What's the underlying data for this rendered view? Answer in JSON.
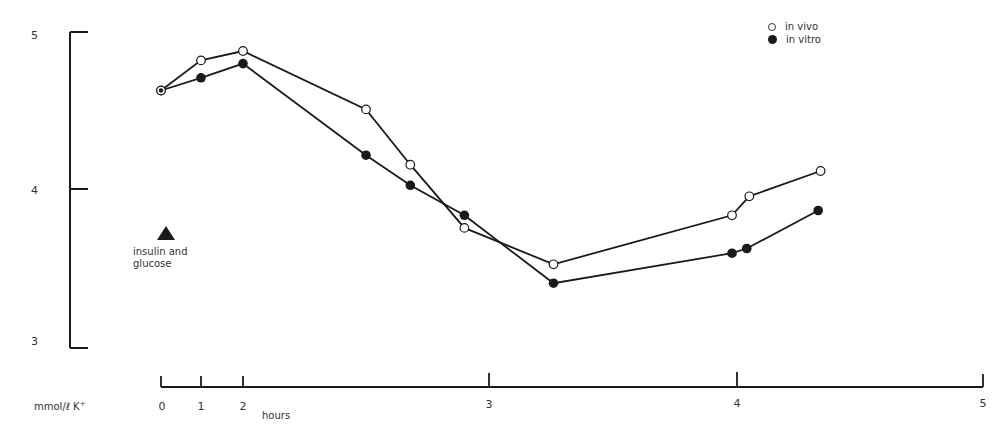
{
  "chart_data": {
    "type": "line",
    "title": "",
    "xlabel": "hours",
    "ylabel": "mmol/ℓ K⁺",
    "x_ticks": [
      "0",
      "1",
      "2",
      "3",
      "4",
      "5"
    ],
    "y_ticks": [
      "3",
      "4",
      "5"
    ],
    "xlim": [
      0,
      5
    ],
    "ylim": [
      3,
      5
    ],
    "grid": false,
    "legend_position": "top-right",
    "series": [
      {
        "name": "in vivo",
        "marker": "open-circle",
        "x": [
          0,
          1,
          2,
          2.5,
          2.68,
          2.9,
          3.26,
          3.98,
          4.05,
          4.34
        ],
        "y": [
          4.63,
          4.82,
          4.88,
          4.51,
          4.16,
          3.76,
          3.53,
          3.84,
          3.96,
          4.12
        ]
      },
      {
        "name": "in vitro",
        "marker": "filled-circle",
        "x": [
          0,
          1,
          2,
          2.5,
          2.68,
          2.9,
          3.26,
          3.98,
          4.04,
          4.33
        ],
        "y": [
          4.63,
          4.71,
          4.8,
          4.22,
          4.03,
          3.84,
          3.41,
          3.6,
          3.63,
          3.87
        ]
      }
    ],
    "annotations": [
      {
        "text": "insulin and glucose",
        "marker": "filled-triangle",
        "note": "administration marker"
      }
    ]
  },
  "axes": {
    "y_unit_label": "mmol/ℓ K",
    "y_unit_superscript": "+",
    "x_unit_label": "hours"
  },
  "legend": {
    "items": [
      {
        "label": "in vivo",
        "marker": "open-circle"
      },
      {
        "label": "in vitro",
        "marker": "filled-circle"
      }
    ]
  },
  "annotation": {
    "line1": "insulin and",
    "line2": "glucose"
  },
  "colors": {
    "ink": "#1a1a1a",
    "background": "#ffffff"
  }
}
